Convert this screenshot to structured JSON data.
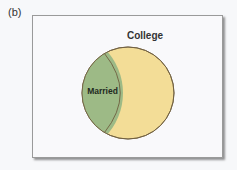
{
  "panel_label": "(b)",
  "diagram": {
    "type": "venn",
    "sets": [
      {
        "name": "College",
        "label": "College",
        "color": "#f3dd97"
      },
      {
        "name": "Married",
        "label": "Married",
        "color": "#9dba86",
        "subset_of": "College"
      }
    ],
    "outline_color": "#6f5f3f",
    "frame_border": "#9a9a9a"
  }
}
